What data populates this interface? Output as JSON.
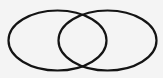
{
  "diagram": {
    "type": "venn",
    "sets": [
      {
        "id": "left",
        "label": "",
        "cx": 57.5,
        "cy": 40.5,
        "rx": 49,
        "ry": 30
      },
      {
        "id": "right",
        "label": "",
        "cx": 107.5,
        "cy": 40.5,
        "rx": 49,
        "ry": 30
      }
    ],
    "colors": {
      "background": "#f4f4f4",
      "stroke": "#141414"
    }
  }
}
